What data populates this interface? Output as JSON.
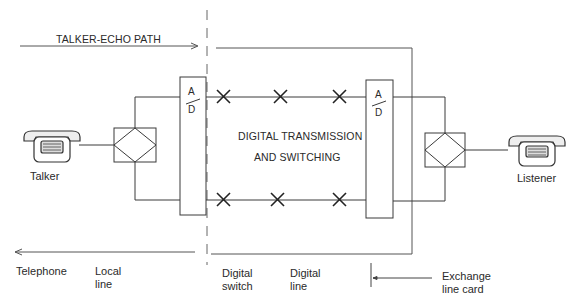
{
  "diagram": {
    "type": "block-diagram",
    "title_path": "TALKER-ECHO PATH",
    "center_label_line1": "DIGITAL TRANSMISSION",
    "center_label_line2": "AND SWITCHING",
    "converters": [
      {
        "id": "left",
        "top": "A",
        "bottom": "D"
      },
      {
        "id": "right",
        "top": "A",
        "bottom": "D"
      }
    ],
    "endpoints": {
      "left": "Talker",
      "right": "Listener"
    },
    "bottom_labels": [
      "Telephone",
      "Local\nline",
      "Digital\nswitch",
      "Digital\nline",
      "Exchange\nline card"
    ],
    "crosspoints_per_path": 3,
    "colors": {
      "line": "#3a3a3a",
      "background": "#ffffff"
    }
  }
}
